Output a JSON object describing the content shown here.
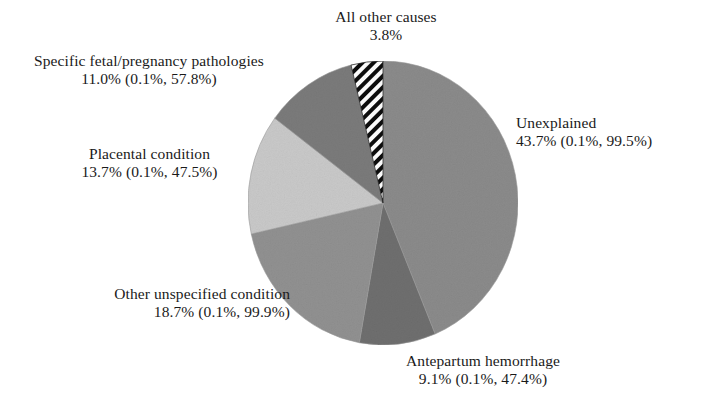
{
  "figure": {
    "background_color": "#ffffff",
    "text_color": "#1a1a1a"
  },
  "chart_data": {
    "type": "pie",
    "title": "",
    "subtitle": "",
    "xlabel": "",
    "ylabel": "",
    "legend_position": "callout-labels",
    "grid": false,
    "value_unit": "percent",
    "value_note": "Percentage of stillbirths by cause, with range across studies in parentheses (min%, max%)",
    "categories": [
      "Unexplained",
      "Antepartum hemorrhage",
      "Other unspecified condition",
      "Placental condition",
      "Specific fetal/pregnancy pathologies",
      "All other causes"
    ],
    "values": [
      43.7,
      9.1,
      18.7,
      13.7,
      11.0,
      3.8
    ],
    "ranges": [
      {
        "low": 0.1,
        "high": 99.5
      },
      {
        "low": 0.1,
        "high": 47.4
      },
      {
        "low": 0.1,
        "high": 99.9
      },
      {
        "low": 0.1,
        "high": 47.5
      },
      {
        "low": 0.1,
        "high": 57.8
      },
      null
    ],
    "slice_colors": [
      "#8b8b8b",
      "#6f6f6f",
      "#919191",
      "#c9c9c9",
      "#7b7b7b",
      "hatch"
    ],
    "start_angle_deg": 0,
    "direction": "clockwise",
    "slices": [
      {
        "name": "unexplained",
        "label": "Unexplained",
        "value_text": "43.7% (0.1%, 99.5%)",
        "percent": 43.7,
        "fill": "#8b8b8b",
        "pattern": "solid",
        "start_deg": 0,
        "end_deg": 157.3
      },
      {
        "name": "antepartum-hemorrhage",
        "label": "Antepartum hemorrhage",
        "value_text": "9.1% (0.1%, 47.4%)",
        "percent": 9.1,
        "fill": "#6f6f6f",
        "pattern": "solid",
        "start_deg": 157.3,
        "end_deg": 190.1
      },
      {
        "name": "other-unspecified-condition",
        "label": "Other unspecified condition",
        "value_text": "18.7% (0.1%, 99.9%)",
        "percent": 18.7,
        "fill": "#919191",
        "pattern": "solid",
        "start_deg": 190.1,
        "end_deg": 257.4
      },
      {
        "name": "placental-condition",
        "label": "Placental condition",
        "value_text": "13.7% (0.1%, 47.5%)",
        "percent": 13.7,
        "fill": "#c9c9c9",
        "pattern": "solid",
        "start_deg": 257.4,
        "end_deg": 306.7
      },
      {
        "name": "specific-fetal-pregnancy-pathologies",
        "label": "Specific fetal/pregnancy pathologies",
        "value_text": "11.0% (0.1%, 57.8%)",
        "percent": 11.0,
        "fill": "#7b7b7b",
        "pattern": "solid",
        "start_deg": 306.7,
        "end_deg": 346.3
      },
      {
        "name": "all-other-causes",
        "label": "All other causes",
        "value_text": "3.8%",
        "percent": 3.8,
        "fill": "url(#hatch-diagonal)",
        "pattern": "diagonal-hatch",
        "start_deg": 346.3,
        "end_deg": 360
      }
    ]
  },
  "labels": {
    "all_other_causes": {
      "line1": "All other causes",
      "line2": "3.8%"
    },
    "specific_fetal": {
      "line1": "Specific fetal/pregnancy pathologies",
      "line2": "11.0% (0.1%, 57.8%)"
    },
    "unexplained": {
      "line1": "Unexplained",
      "line2": "43.7% (0.1%, 99.5%)"
    },
    "placental": {
      "line1": "Placental condition",
      "line2": "13.7% (0.1%, 47.5%)"
    },
    "other_unspecified": {
      "line1": "Other unspecified condition",
      "line2": "18.7% (0.1%, 99.9%)"
    },
    "antepartum": {
      "line1": "Antepartum hemorrhage",
      "line2": "9.1% (0.1%, 47.4%)"
    }
  }
}
